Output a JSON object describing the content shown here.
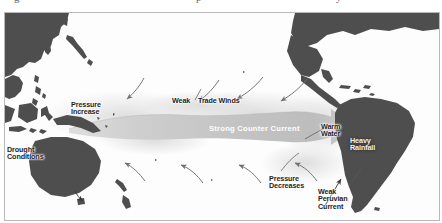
{
  "figure": {
    "cut_off_text_above": "descenders of preceding caption line",
    "border_color": "#b9b9b9",
    "ocean_color": "#fdfdfd",
    "land_color": "#4e4e4e",
    "current_band_color": "#c9c9c9",
    "arrow_color": "#6f6f6f"
  },
  "labels": [
    {
      "id": "pressure-increase",
      "text": "Pressure\nIncrease",
      "style": "dark",
      "x": 66,
      "y": 88,
      "align": "left"
    },
    {
      "id": "drought-conditions",
      "text": "Drought\nConditions",
      "style": "dark",
      "x": 2,
      "y": 133,
      "align": "left"
    },
    {
      "id": "weak-label",
      "text": "Weak",
      "style": "dark",
      "x": 167,
      "y": 84,
      "align": "left"
    },
    {
      "id": "trade-winds-label",
      "text": "Trade Winds",
      "style": "dark",
      "x": 193,
      "y": 84,
      "align": "left"
    },
    {
      "id": "strong-counter-current",
      "text": "Strong Counter Current",
      "style": "light",
      "x": 204,
      "y": 118,
      "align": "left"
    },
    {
      "id": "warm-water",
      "text": "Warm\nWater",
      "style": "dark",
      "x": 316,
      "y": 110,
      "align": "left"
    },
    {
      "id": "heavy-rainfall",
      "text": "Heavy\nRainfall",
      "style": "dark",
      "x": 345,
      "y": 124,
      "align": "left"
    },
    {
      "id": "pressure-decreases",
      "text": "Pressure\nDecreases",
      "style": "dark",
      "x": 264,
      "y": 162,
      "align": "left"
    },
    {
      "id": "weak-peruvian-current",
      "text": "Weak\nPeruvian\nCurrent",
      "style": "dark",
      "x": 313,
      "y": 175,
      "align": "left"
    }
  ],
  "annotations": {
    "trade_wind_arrows": 3,
    "lower_wind_arrows": 4,
    "counter_current_direction": "eastward",
    "peruvian_current_direction": "weakened-northward"
  }
}
